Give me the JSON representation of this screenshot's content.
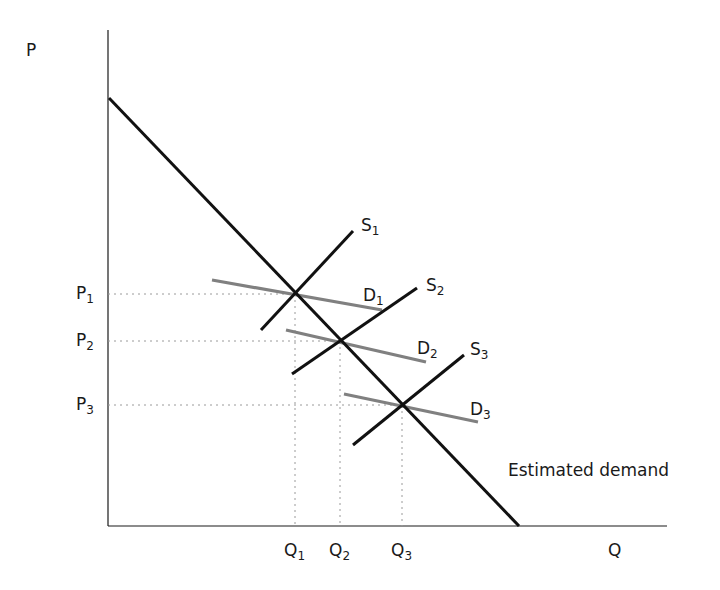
{
  "axes": {
    "y_label": "P",
    "x_label": "Q",
    "origin": [
      108,
      526
    ],
    "y_top": 30,
    "x_right": 667
  },
  "curves": {
    "estimated_demand": {
      "label": "Estimated demand",
      "from": [
        109,
        98
      ],
      "to": [
        519,
        526
      ],
      "color": "#111111"
    },
    "supply": [
      {
        "name": "S",
        "sub": "1",
        "from": [
          261,
          330
        ],
        "to": [
          353,
          231
        ]
      },
      {
        "name": "S",
        "sub": "2",
        "from": [
          292,
          374
        ],
        "to": [
          417,
          288
        ]
      },
      {
        "name": "S",
        "sub": "3",
        "from": [
          353,
          445
        ],
        "to": [
          464,
          355
        ]
      }
    ],
    "demand": [
      {
        "name": "D",
        "sub": "1",
        "from": [
          212,
          280
        ],
        "to": [
          382,
          310
        ],
        "color": "#808080"
      },
      {
        "name": "D",
        "sub": "2",
        "from": [
          286,
          330
        ],
        "to": [
          426,
          362
        ],
        "color": "#808080"
      },
      {
        "name": "D",
        "sub": "3",
        "from": [
          344,
          394
        ],
        "to": [
          478,
          422
        ],
        "color": "#808080"
      }
    ]
  },
  "equilibria": [
    {
      "p_label": "P",
      "p_sub": "1",
      "q_label": "Q",
      "q_sub": "1",
      "x": 295,
      "y": 294
    },
    {
      "p_label": "P",
      "p_sub": "2",
      "q_label": "Q",
      "q_sub": "2",
      "x": 340,
      "y": 341
    },
    {
      "p_label": "P",
      "p_sub": "3",
      "q_label": "Q",
      "q_sub": "3",
      "x": 402,
      "y": 405
    }
  ],
  "labels": {
    "P": "P",
    "Q": "Q",
    "P1": "P",
    "P1_sub": "1",
    "P2": "P",
    "P2_sub": "2",
    "P3": "P",
    "P3_sub": "3",
    "Q1": "Q",
    "Q1_sub": "1",
    "Q2": "Q",
    "Q2_sub": "2",
    "Q3": "Q",
    "Q3_sub": "3",
    "S1": "S",
    "S1_sub": "1",
    "S2": "S",
    "S2_sub": "2",
    "S3": "S",
    "S3_sub": "3",
    "D1": "D",
    "D1_sub": "1",
    "D2": "D",
    "D2_sub": "2",
    "D3": "D",
    "D3_sub": "3",
    "estimated_demand": "Estimated demand"
  },
  "colors": {
    "axis": "#1a1a1a",
    "supply": "#111111",
    "estimated_demand": "#111111",
    "shifted_demand": "#808080",
    "guide": "#9a9a9a"
  }
}
